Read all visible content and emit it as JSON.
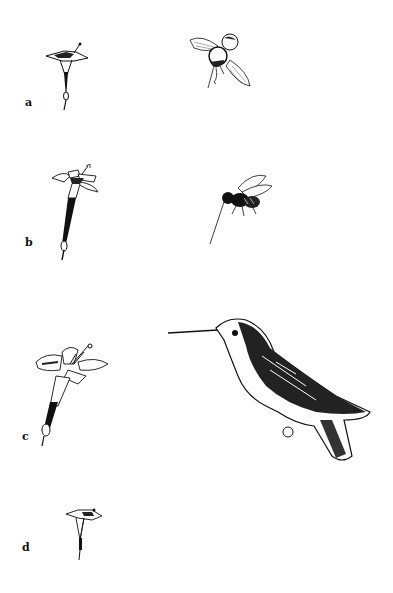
{
  "figure": {
    "panels": [
      {
        "label": "a",
        "flower": "small-tubular-flower",
        "pollinator": "hoverfly"
      },
      {
        "label": "b",
        "flower": "long-tubular-flower",
        "pollinator": "long-tongued-fly"
      },
      {
        "label": "c",
        "flower": "large-trumpet-flower",
        "pollinator": "hummingbird"
      },
      {
        "label": "d",
        "flower": "small-flower",
        "pollinator": null
      }
    ]
  },
  "colors": {
    "ink": "#111111",
    "background": "#ffffff"
  }
}
